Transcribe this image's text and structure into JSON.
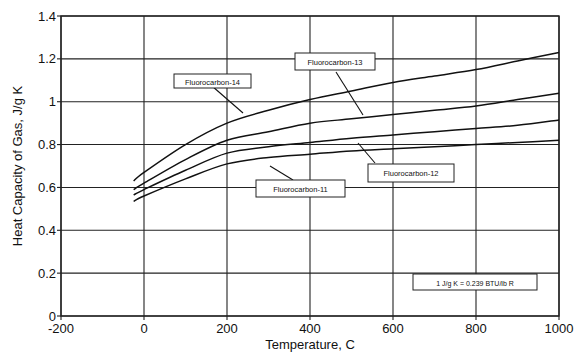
{
  "chart_data": {
    "type": "line",
    "title": "",
    "xlabel": "Temperature, C",
    "ylabel": "Heat Capacity of Gas,  J/g K",
    "xlim": [
      -200,
      1000
    ],
    "ylim": [
      0,
      1.4
    ],
    "xticks": [
      -200,
      0,
      200,
      400,
      600,
      800,
      1000
    ],
    "xtick_labels": [
      "-200",
      "0",
      "200",
      "400",
      "600",
      "800",
      "1000"
    ],
    "yticks": [
      0,
      0.2,
      0.4,
      0.6,
      0.8,
      1.0,
      1.2,
      1.4
    ],
    "ytick_labels": [
      "0",
      "0.2",
      "0.4",
      "0.6",
      "0.8",
      "1",
      "1.2",
      "1.4"
    ],
    "grid": true,
    "legend": "callout labels on curves",
    "x": [
      -25,
      0,
      100,
      200,
      300,
      400,
      500,
      600,
      700,
      800,
      900,
      1000
    ],
    "series": [
      {
        "name": "Fluorocarbon-14",
        "values": [
          0.63,
          0.67,
          0.8,
          0.9,
          0.96,
          1.01,
          1.05,
          1.09,
          1.12,
          1.15,
          1.19,
          1.23
        ]
      },
      {
        "name": "Fluorocarbon-13",
        "values": [
          0.59,
          0.62,
          0.73,
          0.82,
          0.86,
          0.9,
          0.92,
          0.94,
          0.96,
          0.98,
          1.01,
          1.04
        ]
      },
      {
        "name": "Fluorocarbon-12",
        "values": [
          0.565,
          0.59,
          0.68,
          0.76,
          0.79,
          0.81,
          0.83,
          0.845,
          0.86,
          0.875,
          0.89,
          0.915
        ]
      },
      {
        "name": "Fluorocarbon-11",
        "values": [
          0.535,
          0.56,
          0.64,
          0.71,
          0.74,
          0.755,
          0.77,
          0.78,
          0.79,
          0.8,
          0.81,
          0.82
        ]
      }
    ],
    "annotations": [
      {
        "text": "Fluorocarbon-14",
        "target_series": "Fluorocarbon-14"
      },
      {
        "text": "Fluorocarbon-13",
        "target_series": "Fluorocarbon-13"
      },
      {
        "text": "Fluorocarbon-12",
        "target_series": "Fluorocarbon-12"
      },
      {
        "text": "Fluorocarbon-11",
        "target_series": "Fluorocarbon-11"
      },
      {
        "text": "1 J/g K = 0.239 BTU/lb R",
        "target_series": null
      }
    ]
  },
  "labels": {
    "fc14": "Fluorocarbon-14",
    "fc13": "Fluorocarbon-13",
    "fc12": "Fluorocarbon-12",
    "fc11": "Fluorocarbon-11",
    "conversion": "1 J/g K = 0.239 BTU/lb R",
    "xlabel": "Temperature, C",
    "ylabel": "Heat Capacity of Gas,  J/g K"
  },
  "colors": {
    "line": "#111111",
    "grid": "#222222",
    "background": "#ffffff"
  }
}
